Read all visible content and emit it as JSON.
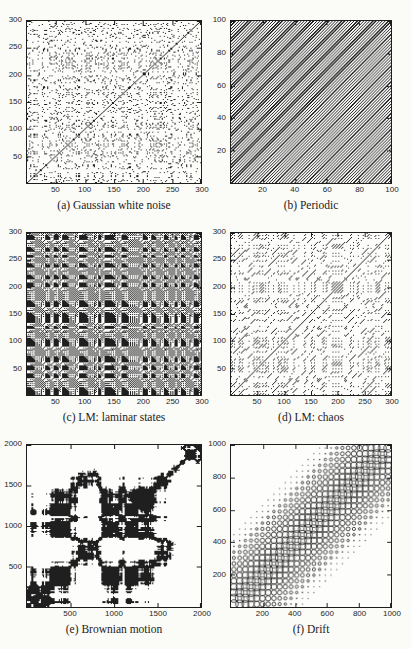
{
  "page": {
    "paper_color": "#fbfbf8",
    "plot_background": "#fdfdfc",
    "ink_color": "#1f1f1f",
    "axis_color": "#1e1e1e"
  },
  "chart_data": [
    {
      "id": "a",
      "type": "heatmap",
      "caption": "(a) Gaussian white noise",
      "xlabel": "",
      "ylabel": "",
      "x_range": [
        1,
        300
      ],
      "y_range": [
        1,
        300
      ],
      "x_ticks": [
        50,
        100,
        150,
        200,
        250,
        300
      ],
      "y_ticks": [
        50,
        100,
        150,
        200,
        250,
        300
      ],
      "description": "Recurrence plot of Gaussian white noise: uniformly scattered isolated dark points plus the thin main diagonal line from bottom-left to top-right.",
      "generator": {
        "kind": "rp",
        "series": "gaussian",
        "n": 164,
        "recurrence_rate": 0.1,
        "seed": 101
      }
    },
    {
      "id": "b",
      "type": "heatmap",
      "caption": "(b) Periodic",
      "xlabel": "",
      "ylabel": "",
      "x_range": [
        1,
        100
      ],
      "y_range": [
        1,
        100
      ],
      "x_ticks": [
        20,
        40,
        60,
        80,
        100
      ],
      "y_ticks": [
        20,
        40,
        60,
        80,
        100
      ],
      "description": "Recurrence plot of a periodic signal: uninterrupted, equally spaced fine diagonal stripes parallel to the main diagonal covering the whole square.",
      "generator": {
        "kind": "stripes",
        "period_px": 3.2,
        "line_px": 1.35
      }
    },
    {
      "id": "c",
      "type": "heatmap",
      "caption": "(c) LM: laminar states",
      "xlabel": "",
      "ylabel": "",
      "x_range": [
        1,
        300
      ],
      "y_range": [
        1,
        300
      ],
      "x_ticks": [
        50,
        100,
        150,
        200,
        250,
        300
      ],
      "y_ticks": [
        50,
        100,
        150,
        200,
        250,
        300
      ],
      "description": "Recurrence plot of the logistic map with laminar states: dense dark texture organised in vertical and horizontal bands and black rectangular blocks.",
      "generator": {
        "kind": "rp",
        "series": "logistic",
        "r": 3.679,
        "x0": 0.64,
        "burn": 400,
        "n": 164,
        "recurrence_rate": 0.48,
        "seed": 7
      }
    },
    {
      "id": "d",
      "type": "heatmap",
      "caption": "(d) LM: chaos",
      "xlabel": "",
      "ylabel": "",
      "x_range": [
        1,
        300
      ],
      "y_range": [
        1,
        300
      ],
      "x_ticks": [
        50,
        100,
        150,
        200,
        250,
        300
      ],
      "y_ticks": [
        50,
        100,
        150,
        200,
        250,
        300
      ],
      "description": "Recurrence plot of the chaotic logistic map: sparse short diagonal line segments clustered in bands, with a clear continuous main diagonal.",
      "generator": {
        "kind": "rp",
        "series": "logistic",
        "r": 3.9,
        "x0": 0.51,
        "burn": 400,
        "n": 164,
        "recurrence_rate": 0.09,
        "seed": 11
      }
    },
    {
      "id": "e",
      "type": "heatmap",
      "caption": "(e) Brownian motion",
      "xlabel": "",
      "ylabel": "",
      "x_range": [
        1,
        2000
      ],
      "y_range": [
        1,
        2000
      ],
      "x_ticks": [
        500,
        1000,
        1500,
        2000
      ],
      "y_ticks": [
        500,
        1000,
        1500,
        2000
      ],
      "description": "Recurrence plot of Brownian motion: large irregular solid black patches (bottom-left block, upper blocks, central X-shaped cluster) separated by wide white areas.",
      "generator": {
        "kind": "rp",
        "series": "brownian",
        "n": 164,
        "recurrence_rate": 0.28,
        "seed": 4242
      }
    },
    {
      "id": "f",
      "type": "scatter",
      "caption": "(f) Drift",
      "xlabel": "",
      "ylabel": "",
      "x_range": [
        1,
        1000
      ],
      "y_range": [
        1,
        1000
      ],
      "x_ticks": [
        200,
        400,
        600,
        800,
        1000
      ],
      "y_ticks": [
        200,
        400,
        600,
        800,
        1000
      ],
      "description": "Recurrence plot with drift: a regular grid of open circles whose size shrinks with distance from the main diagonal; large overlapping circles form an X-lattice along the diagonal, fading to small dots and empty corners away from it.",
      "generator": {
        "kind": "drift_circles",
        "grid_count": 28,
        "max_radius_px": 4.4,
        "band_halfwidth_px": 74,
        "line_px": 0.8
      }
    }
  ]
}
